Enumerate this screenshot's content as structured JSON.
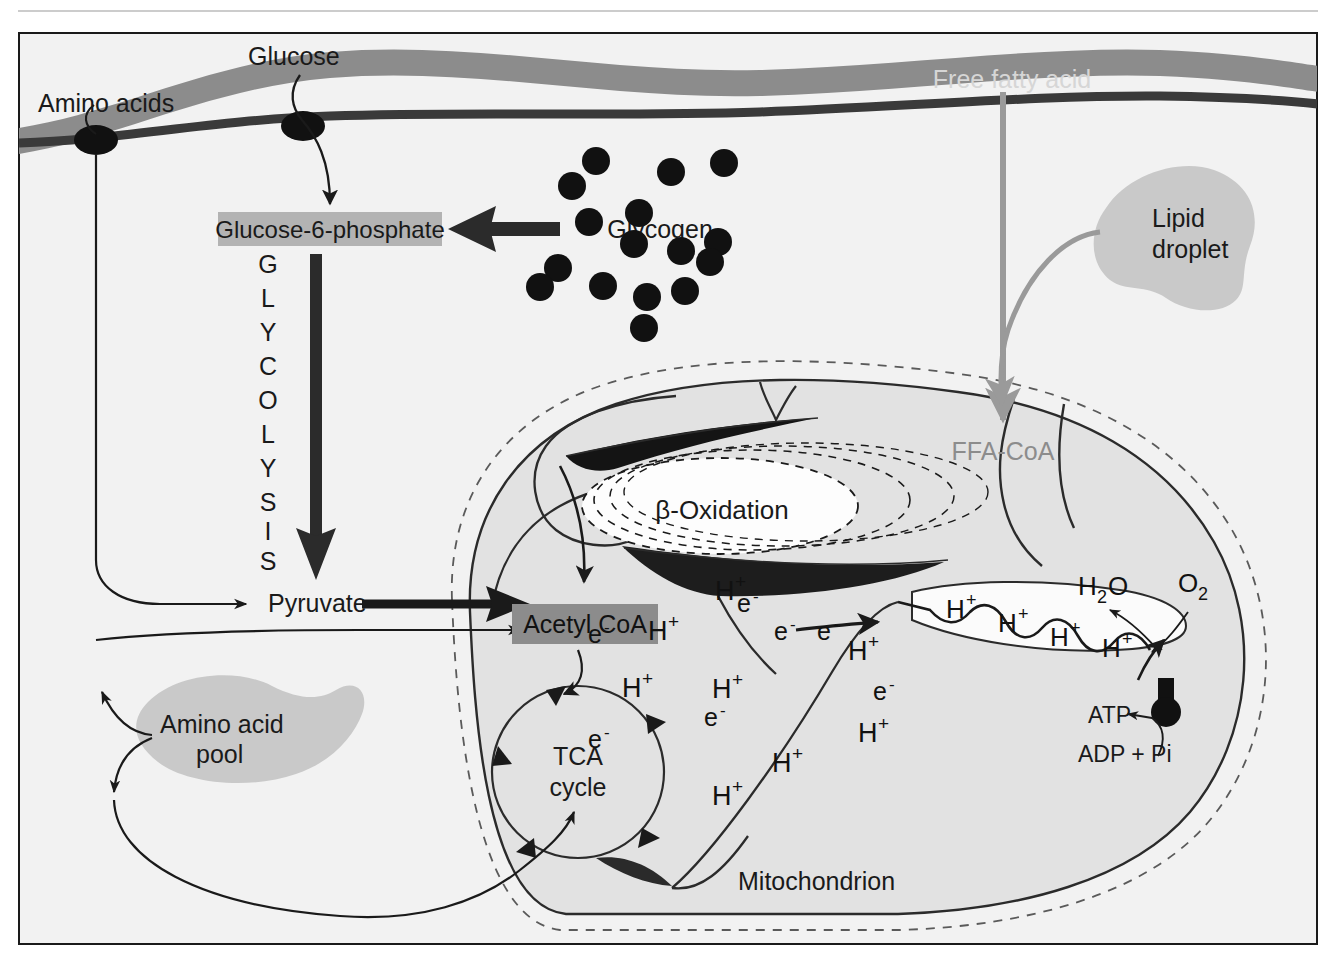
{
  "figure": {
    "colors": {
      "membrane_outer_band": "#8c8c8c",
      "membrane_inner_line": "#4d4d4d",
      "cell_background": "#f2f2f2",
      "mitochondrion_fill": "#e2e2e2",
      "highlight_box": "#b3b3b3",
      "acetyl_box": "#8c8c8c",
      "organelle_fill": "#c9c9c9",
      "gray_text": "#8c8c8c",
      "white_text": "#ffffff",
      "ink": "#1a1a1a"
    }
  },
  "labels": {
    "amino_acids": "Amino acids",
    "glucose": "Glucose",
    "free_fatty_acid": "Free fatty acid",
    "glucose6phosphate": "Glucose-6-phosphate",
    "glycogen": "Glycogen",
    "lipid_droplet_line1": "Lipid",
    "lipid_droplet_line2": "droplet",
    "glycolysis_letters": [
      "G",
      "L",
      "Y",
      "C",
      "O",
      "L",
      "Y",
      "S",
      "I",
      "S"
    ],
    "ffa_coa": "FFA-CoA",
    "beta_oxidation": "β-Oxidation",
    "pyruvate": "Pyruvate",
    "acetyl_coa": "Acetyl CoA",
    "tca_line1": "TCA",
    "tca_line2": "cycle",
    "amino_acid_pool_line1": "Amino acid",
    "amino_acid_pool_line2": "pool",
    "mitochondrion": "Mitochondrion",
    "water": "H",
    "water_sub": "2",
    "water_o": "O",
    "oxygen": "O",
    "oxygen_sub": "2",
    "atp": "ATP",
    "adp_pi": "ADP + Pi"
  },
  "particles": {
    "proton_label": "H",
    "proton_charge": "+",
    "electron_label": "e",
    "electron_charge": "-",
    "matrix_species": [
      {
        "type": "electron",
        "x": 588,
        "y": 643
      },
      {
        "type": "proton",
        "x": 648,
        "y": 640
      },
      {
        "type": "electron",
        "x": 620,
        "y": 641
      },
      {
        "type": "proton",
        "x": 715,
        "y": 600
      },
      {
        "type": "electron",
        "x": 742,
        "y": 612
      },
      {
        "type": "electron",
        "x": 817,
        "y": 640
      },
      {
        "type": "proton",
        "x": 848,
        "y": 655
      },
      {
        "type": "proton",
        "x": 712,
        "y": 698
      },
      {
        "type": "electron",
        "x": 774,
        "y": 640
      },
      {
        "type": "proton",
        "x": 620,
        "y": 697
      },
      {
        "type": "electron",
        "x": 873,
        "y": 700
      },
      {
        "type": "proton",
        "x": 858,
        "y": 742
      },
      {
        "type": "electron",
        "x": 704,
        "y": 726
      },
      {
        "type": "electron",
        "x": 588,
        "y": 748
      },
      {
        "type": "proton",
        "x": 772,
        "y": 772
      },
      {
        "type": "proton",
        "x": 712,
        "y": 805
      }
    ],
    "intermembrane_protons": [
      {
        "x": 952,
        "y": 613
      },
      {
        "x": 1002,
        "y": 627
      },
      {
        "x": 1055,
        "y": 641
      },
      {
        "x": 1108,
        "y": 652
      }
    ]
  },
  "glycogen_granules": [
    {
      "x": 596,
      "y": 161
    },
    {
      "x": 589,
      "y": 222
    },
    {
      "x": 639,
      "y": 213
    },
    {
      "x": 671,
      "y": 172
    },
    {
      "x": 681,
      "y": 251
    },
    {
      "x": 724,
      "y": 163
    },
    {
      "x": 634,
      "y": 244
    },
    {
      "x": 572,
      "y": 186
    },
    {
      "x": 718,
      "y": 242
    },
    {
      "x": 710,
      "y": 262
    },
    {
      "x": 685,
      "y": 291
    },
    {
      "x": 558,
      "y": 268
    },
    {
      "x": 603,
      "y": 286
    },
    {
      "x": 647,
      "y": 297
    },
    {
      "x": 540,
      "y": 287
    },
    {
      "x": 644,
      "y": 328
    }
  ],
  "flows": [
    {
      "name": "glucose-uptake",
      "from": "Glucose",
      "to": "Glucose-6-phosphate"
    },
    {
      "name": "glycogenolysis",
      "from": "Glycogen",
      "to": "Glucose-6-phosphate"
    },
    {
      "name": "glycolysis",
      "from": "Glucose-6-phosphate",
      "to": "Pyruvate"
    },
    {
      "name": "amino-acid-uptake",
      "from": "Amino acids",
      "to": "Amino acid pool"
    },
    {
      "name": "amino-acids-to-pyruvate",
      "from": "Amino acid pool",
      "to": "Pyruvate"
    },
    {
      "name": "amino-acids-to-tca",
      "from": "Amino acid pool",
      "to": "TCA cycle"
    },
    {
      "name": "pyruvate-to-acetylcoa",
      "from": "Pyruvate",
      "to": "Acetyl CoA"
    },
    {
      "name": "ffa-uptake",
      "from": "Free fatty acid",
      "to": "FFA-CoA"
    },
    {
      "name": "lipolysis",
      "from": "Lipid droplet",
      "to": "FFA-CoA"
    },
    {
      "name": "beta-oxidation-out",
      "from": "β-Oxidation",
      "to": "Acetyl CoA"
    },
    {
      "name": "acetylcoa-to-tca",
      "from": "Acetyl CoA",
      "to": "TCA cycle"
    },
    {
      "name": "tca-to-etc",
      "from": "TCA cycle",
      "to": "Electron transport chain"
    },
    {
      "name": "o2-to-water",
      "from": "O2",
      "to": "H2O"
    },
    {
      "name": "atp-synthesis",
      "from": "ADP + Pi",
      "to": "ATP"
    }
  ]
}
